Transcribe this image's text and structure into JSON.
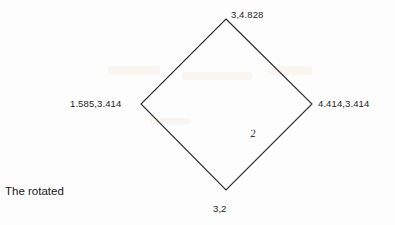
{
  "figure": {
    "caption": "The rotated",
    "edge_label": "2",
    "stroke_color": "#2a2a2a",
    "background_color": "#fdfdfd",
    "text_color": "#1d1d1d"
  },
  "vertices": [
    {
      "name": "top",
      "label": "3,4.828",
      "x": 226,
      "y": 19
    },
    {
      "name": "right",
      "label": "4.414,3.414",
      "x": 312,
      "y": 104
    },
    {
      "name": "bottom",
      "label": "3,2",
      "x": 226,
      "y": 190
    },
    {
      "name": "left",
      "label": "1.585,3.414",
      "x": 141,
      "y": 104
    }
  ],
  "chart_data": {
    "type": "scatter",
    "title": "The rotated",
    "xlabel": "",
    "ylabel": "",
    "shape": "rotated square (diamond)",
    "categories": [
      "top",
      "right",
      "bottom",
      "left"
    ],
    "points": [
      {
        "label": "3,4.828",
        "x": 3,
        "y": 4.828
      },
      {
        "label": "4.414,3.414",
        "x": 4.414,
        "y": 3.414
      },
      {
        "label": "3,2",
        "x": 3,
        "y": 2
      },
      {
        "label": "1.585,3.414",
        "x": 1.585,
        "y": 3.414
      }
    ],
    "annotations": [
      {
        "text": "2",
        "describes": "side length of the rotated square",
        "edge": "bottom-right"
      }
    ],
    "xlim": [
      1.585,
      4.414
    ],
    "ylim": [
      2,
      4.828
    ],
    "grid": false,
    "legend": "none"
  }
}
